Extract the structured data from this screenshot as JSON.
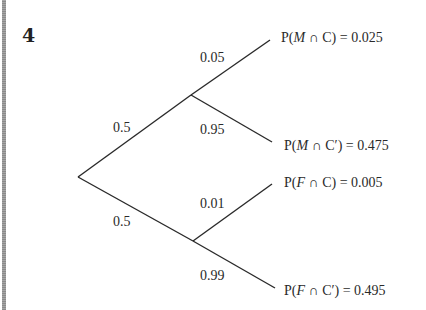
{
  "question_number": "4",
  "diagram": {
    "type": "probability-tree",
    "root": {
      "x": 78,
      "y": 177
    },
    "branches": [
      {
        "label": "0.5",
        "node": {
          "x": 191,
          "y": 95
        },
        "children": [
          {
            "label": "0.05",
            "end": {
              "x": 270,
              "y": 40
            },
            "outcome": {
              "prefix": "P(",
              "A": "M",
              "op": " ∩ ",
              "B": "C",
              "suffix": ") = 0.025"
            }
          },
          {
            "label": "0.95",
            "end": {
              "x": 272,
              "y": 142
            },
            "outcome": {
              "prefix": "P(",
              "A": "M",
              "op": " ∩ ",
              "B": "C′",
              "suffix": ") = 0.475"
            }
          }
        ]
      },
      {
        "label": "0.5",
        "node": {
          "x": 193,
          "y": 241
        },
        "children": [
          {
            "label": "0.01",
            "end": {
              "x": 272,
              "y": 184
            },
            "outcome": {
              "prefix": "P(",
              "A": "F",
              "op": " ∩ ",
              "B": "C",
              "suffix": ") = 0.005"
            }
          },
          {
            "label": "0.99",
            "end": {
              "x": 275,
              "y": 288
            },
            "outcome": {
              "prefix": "P(",
              "A": "F",
              "op": " ∩ ",
              "B": "C′",
              "suffix": ") = 0.495"
            }
          }
        ]
      }
    ]
  },
  "colors": {
    "ink": "#2a2a2a",
    "side_bar": "#8a8a8a",
    "background": "#ffffff"
  }
}
